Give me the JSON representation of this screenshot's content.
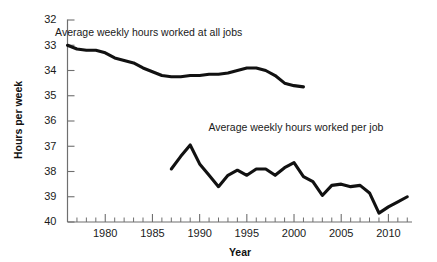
{
  "chart_data": {
    "type": "line",
    "title": "",
    "xlabel": "Year",
    "ylabel": "Hours per week",
    "xlim": [
      1976,
      2012.5
    ],
    "ylim": [
      32,
      40
    ],
    "grid": false,
    "legend_position": "inline-annotation",
    "y_ticks": [
      32,
      33,
      34,
      35,
      36,
      37,
      38,
      39,
      40
    ],
    "x_ticks_major": [
      1980,
      1985,
      1990,
      1995,
      2000,
      2005,
      2010
    ],
    "x_tick_interval_minor": 1,
    "series": [
      {
        "name": "Average weekly hours worked at all jobs",
        "label_x": 1984.6,
        "label_y": 39.35,
        "x": [
          1976,
          1977,
          1978,
          1979,
          1980,
          1981,
          1982,
          1983,
          1984,
          1985,
          1986,
          1987,
          1988,
          1989,
          1990,
          1991,
          1992,
          1993,
          1994,
          1995,
          1996,
          1997,
          1998,
          1999,
          2000,
          2001
        ],
        "y": [
          39.0,
          38.85,
          38.8,
          38.8,
          38.7,
          38.5,
          38.4,
          38.3,
          38.1,
          37.95,
          37.8,
          37.75,
          37.75,
          37.8,
          37.8,
          37.85,
          37.85,
          37.9,
          38.0,
          38.1,
          38.1,
          38.0,
          37.8,
          37.5,
          37.4,
          37.35
        ]
      },
      {
        "name": "Average weekly hours worked per job",
        "label_x": 2000.2,
        "label_y": 35.6,
        "x": [
          1987,
          1988,
          1989,
          1990,
          1991,
          1992,
          1993,
          1994,
          1995,
          1996,
          1997,
          1998,
          1999,
          2000,
          2001,
          2002,
          2003,
          2004,
          2005,
          2006,
          2007,
          2008,
          2009,
          2010,
          2011,
          2012
        ],
        "y": [
          34.1,
          34.6,
          35.05,
          34.3,
          33.85,
          33.4,
          33.85,
          34.05,
          33.85,
          34.1,
          34.1,
          33.85,
          34.15,
          34.35,
          33.8,
          33.6,
          33.05,
          33.45,
          33.5,
          33.4,
          33.45,
          33.15,
          32.35,
          32.6,
          32.8,
          33.0
        ]
      }
    ]
  },
  "axes": {
    "y_label": "Hours per week",
    "x_label": "Year",
    "y_tick_labels": [
      "40",
      "39",
      "38",
      "37",
      "36",
      "35",
      "34",
      "33",
      "32"
    ],
    "x_tick_labels": [
      "1980",
      "1985",
      "1990",
      "1995",
      "2000",
      "2005",
      "2010"
    ]
  },
  "annotations": {
    "top_series_label": "Average weekly hours worked at all jobs",
    "bottom_series_label": "Average weekly hours worked per job"
  }
}
